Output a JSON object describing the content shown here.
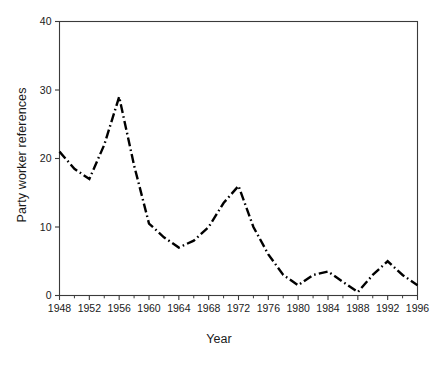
{
  "chart_data": {
    "type": "line",
    "title": "",
    "xlabel": "Year",
    "ylabel": "Party worker references",
    "xlim": [
      1948,
      1996
    ],
    "ylim": [
      0,
      40
    ],
    "grid": false,
    "legend": false,
    "line_style": "dash-dot",
    "line_color": "#000000",
    "line_width": 2.4,
    "x_tick_labels": [
      "1948",
      "1952",
      "1956",
      "1960",
      "1964",
      "1968",
      "1972",
      "1976",
      "1980",
      "1984",
      "1988",
      "1992",
      "1996"
    ],
    "x_tick_values": [
      1948,
      1952,
      1956,
      1960,
      1964,
      1968,
      1972,
      1976,
      1980,
      1984,
      1988,
      1992,
      1996
    ],
    "x_minor_tick_values": [
      1950,
      1954,
      1958,
      1962,
      1966,
      1970,
      1974,
      1978,
      1982,
      1986,
      1990,
      1994
    ],
    "y_tick_labels": [
      "0",
      "10",
      "20",
      "30",
      "40"
    ],
    "y_tick_values": [
      0,
      10,
      20,
      30,
      40
    ],
    "x": [
      1948,
      1950,
      1952,
      1954,
      1956,
      1958,
      1960,
      1962,
      1964,
      1966,
      1968,
      1970,
      1972,
      1974,
      1976,
      1978,
      1980,
      1982,
      1984,
      1986,
      1988,
      1990,
      1992,
      1994,
      1996
    ],
    "values": [
      21,
      18.5,
      17,
      22,
      29,
      19,
      10.5,
      8.5,
      7,
      8,
      10,
      13.5,
      16,
      10,
      6,
      3,
      1.5,
      3,
      3.5,
      2,
      0.5,
      3,
      5,
      3,
      1.5
    ],
    "series": [
      {
        "name": "Party worker references",
        "values": [
          21,
          18.5,
          17,
          22,
          29,
          19,
          10.5,
          8.5,
          7,
          8,
          10,
          13.5,
          16,
          10,
          6,
          3,
          1.5,
          3,
          3.5,
          2,
          0.5,
          3,
          5,
          3,
          1.5
        ]
      }
    ]
  },
  "axes": {
    "ylabel": "Party worker references",
    "xlabel": "Year"
  }
}
